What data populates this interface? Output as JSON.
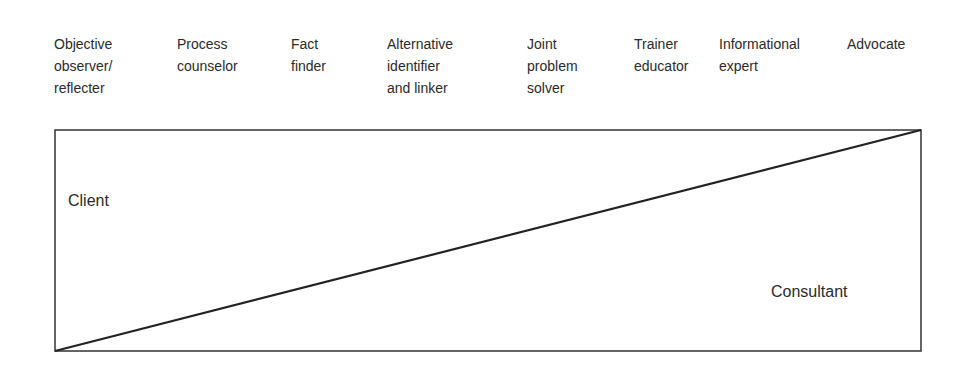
{
  "roles": [
    {
      "label": "Objective\nobserver/\nreflecter",
      "x": 54
    },
    {
      "label": "Process\ncounselor",
      "x": 177
    },
    {
      "label": "Fact\nfinder",
      "x": 291
    },
    {
      "label": "Alternative\nidentifier\nand linker",
      "x": 387
    },
    {
      "label": "Joint\nproblem\nsolver",
      "x": 527
    },
    {
      "label": "Trainer\neducator",
      "x": 634
    },
    {
      "label": "Informational\nexpert",
      "x": 719
    },
    {
      "label": "Advocate",
      "x": 847
    }
  ],
  "regions": {
    "client": "Client",
    "consultant": "Consultant"
  },
  "diagram": {
    "box": {
      "x": 55,
      "y": 130,
      "width": 866,
      "height": 221
    },
    "line_color": "#222222"
  }
}
